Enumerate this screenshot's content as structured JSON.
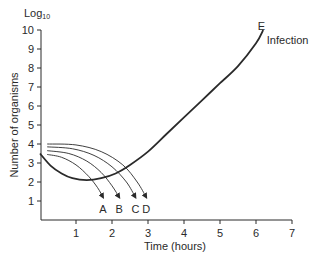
{
  "chart_data": {
    "type": "line",
    "title": "",
    "unit_label": "Log",
    "unit_subscript": "10",
    "xlabel": "Time (hours)",
    "ylabel": "Number of organisms",
    "xlim": [
      0,
      7
    ],
    "ylim": [
      0,
      10
    ],
    "xticks": [
      1,
      2,
      3,
      4,
      5,
      6,
      7
    ],
    "yticks": [
      1,
      2,
      3,
      4,
      5,
      6,
      7,
      8,
      9,
      10
    ],
    "grid": false,
    "series": [
      {
        "name": "E",
        "annotation": "Infection",
        "style": "thick",
        "points": [
          [
            0,
            3.5
          ],
          [
            0.3,
            2.85
          ],
          [
            0.6,
            2.45
          ],
          [
            0.9,
            2.2
          ],
          [
            1.3,
            2.1
          ],
          [
            1.7,
            2.2
          ],
          [
            2.1,
            2.45
          ],
          [
            2.5,
            2.9
          ],
          [
            3.0,
            3.6
          ],
          [
            3.5,
            4.5
          ],
          [
            4.0,
            5.4
          ],
          [
            4.5,
            6.3
          ],
          [
            5.0,
            7.2
          ],
          [
            5.5,
            8.1
          ],
          [
            6.0,
            9.3
          ],
          [
            6.2,
            10.0
          ]
        ]
      },
      {
        "name": "A",
        "style": "arrow",
        "points": [
          [
            0.2,
            3.45
          ],
          [
            0.6,
            3.3
          ],
          [
            1.0,
            2.9
          ],
          [
            1.35,
            2.3
          ],
          [
            1.6,
            1.7
          ],
          [
            1.75,
            1.2
          ]
        ]
      },
      {
        "name": "B",
        "style": "arrow",
        "points": [
          [
            0.2,
            3.65
          ],
          [
            0.8,
            3.5
          ],
          [
            1.3,
            3.1
          ],
          [
            1.7,
            2.5
          ],
          [
            2.0,
            1.8
          ],
          [
            2.2,
            1.2
          ]
        ]
      },
      {
        "name": "C",
        "style": "arrow",
        "points": [
          [
            0.2,
            3.85
          ],
          [
            0.9,
            3.75
          ],
          [
            1.5,
            3.4
          ],
          [
            2.0,
            2.8
          ],
          [
            2.4,
            2.0
          ],
          [
            2.65,
            1.2
          ]
        ]
      },
      {
        "name": "D",
        "style": "arrow",
        "points": [
          [
            0.2,
            4.0
          ],
          [
            1.0,
            3.95
          ],
          [
            1.7,
            3.6
          ],
          [
            2.3,
            2.9
          ],
          [
            2.7,
            2.0
          ],
          [
            2.95,
            1.2
          ]
        ]
      }
    ],
    "arrow_labels": [
      {
        "text": "A",
        "x": 1.75,
        "y": 0.6
      },
      {
        "text": "B",
        "x": 2.2,
        "y": 0.6
      },
      {
        "text": "C",
        "x": 2.65,
        "y": 0.6
      },
      {
        "text": "D",
        "x": 2.95,
        "y": 0.6
      }
    ],
    "end_label": {
      "text": "E",
      "x": 6.15,
      "y": 10.2
    },
    "infection_label": {
      "text": "Infection",
      "x": 6.3,
      "y": 9.5
    }
  }
}
